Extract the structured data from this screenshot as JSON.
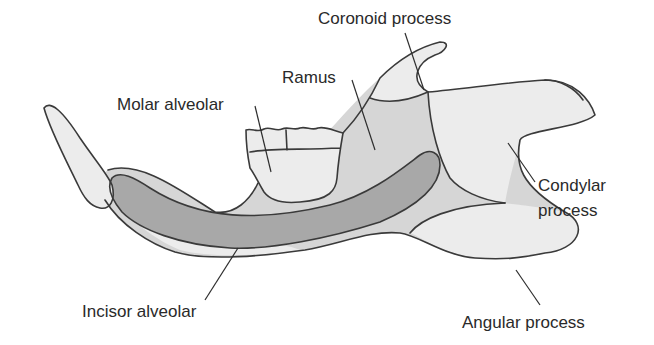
{
  "diagram": {
    "colors": {
      "light_region": "#ececec",
      "mid_region": "#d6d6d6",
      "dark_region": "#a8a8a8",
      "outline": "#3a3a3a",
      "text": "#2a2a2a"
    },
    "labels": {
      "coronoid": "Coronoid process",
      "ramus": "Ramus",
      "molar": "Molar alveolar",
      "condylar_line1": "Condylar",
      "condylar_line2": "process",
      "incisor": "Incisor alveolar",
      "angular": "Angular process"
    }
  }
}
